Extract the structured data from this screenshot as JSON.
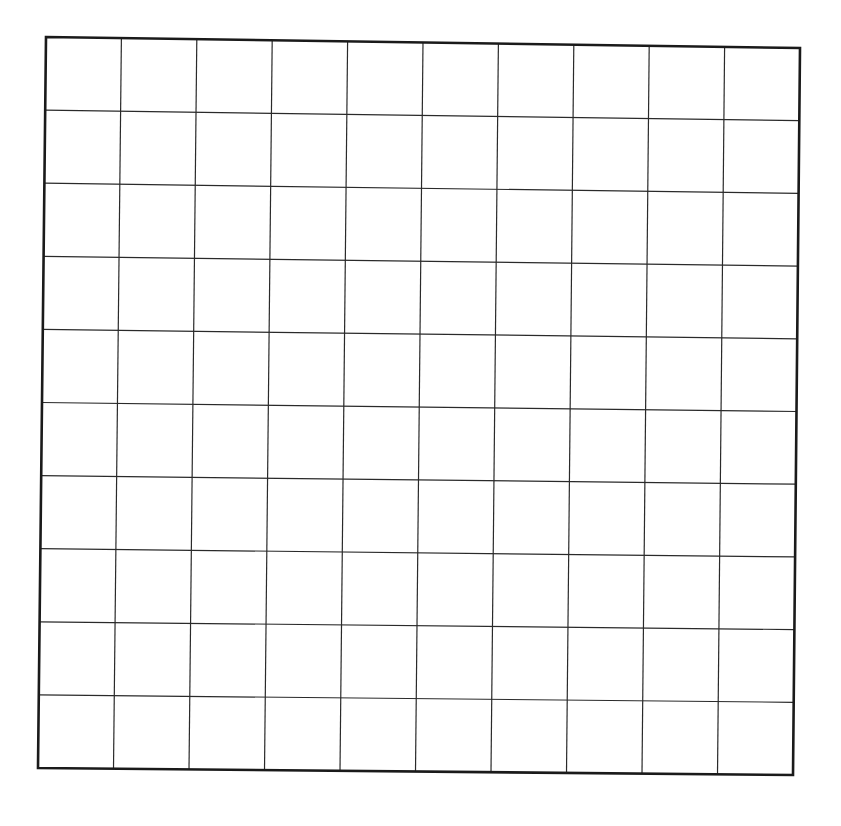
{
  "grid": {
    "rows": 10,
    "cols": 10,
    "line_color": "#2a2a2a",
    "border_color": "#1a1a1a",
    "background": "#ffffff",
    "corners": {
      "top_left": [
        46,
        37
      ],
      "top_right": [
        800,
        48
      ],
      "bottom_left": [
        38,
        768
      ],
      "bottom_right": [
        793,
        775
      ]
    }
  }
}
